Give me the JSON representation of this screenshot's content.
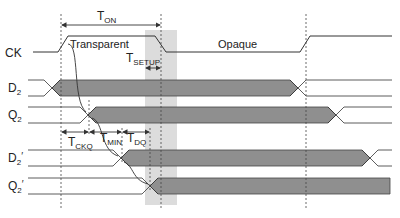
{
  "diagram": {
    "type": "timing-diagram",
    "colors": {
      "bus_fill": "#8f8f8f",
      "line": "#333333",
      "shade": "#d9d9d9"
    },
    "signals": [
      {
        "id": "ck",
        "label": "CK",
        "sub": ""
      },
      {
        "id": "d2",
        "label": "D",
        "sub": "2",
        "prime": ""
      },
      {
        "id": "q2",
        "label": "Q",
        "sub": "2",
        "prime": ""
      },
      {
        "id": "d2p",
        "label": "D",
        "sub": "2",
        "prime": "′"
      },
      {
        "id": "q2p",
        "label": "Q",
        "sub": "2",
        "prime": "′"
      }
    ],
    "annotations": {
      "ton": {
        "main": "T",
        "sub": "ON"
      },
      "tsetup": {
        "main": "T",
        "sub": "SETUP"
      },
      "tckq": {
        "main": "T",
        "sub": "CKQ"
      },
      "tmin": {
        "main": "T",
        "sub": "MIN"
      },
      "tdq": {
        "main": "T",
        "sub": "DQ"
      },
      "transparent": "Transparent",
      "opaque": "Opaque"
    }
  }
}
